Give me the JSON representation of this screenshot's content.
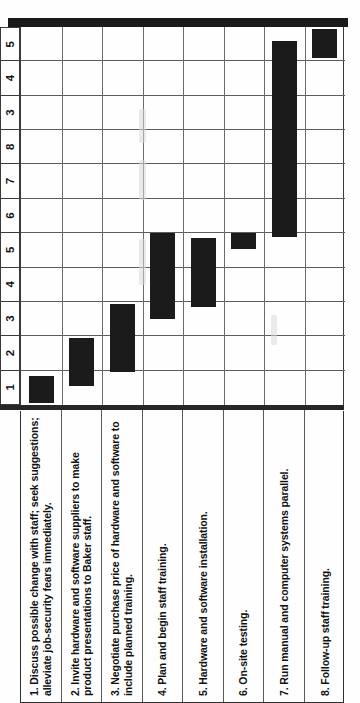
{
  "figure": {
    "kind": "gantt-chart",
    "orientation": "rotated-90",
    "group_labels": {
      "weeks": "Weeks",
      "months": "Months"
    }
  },
  "axis": {
    "week_ticks": [
      "1",
      "2",
      "3",
      "4",
      "5",
      "6",
      "7",
      "8"
    ],
    "month_ticks": [
      "3",
      "4",
      "5"
    ]
  },
  "tasks": [
    {
      "num": "1.",
      "text": "Discuss possible change with staff; seek suggestions; alleviate job-security fears immediately."
    },
    {
      "num": "2.",
      "text": "Invite hardware and software suppliers to make product presentations to Baker staff."
    },
    {
      "num": "3.",
      "text": "Negotiate purchase price of hardware and software to include planned training."
    },
    {
      "num": "4.",
      "text": "Plan and begin staff training."
    },
    {
      "num": "5.",
      "text": "Hardware and software installation."
    },
    {
      "num": "6.",
      "text": "On-site testing."
    },
    {
      "num": "7.",
      "text": "Run manual and computer systems parallel."
    },
    {
      "num": "8.",
      "text": "Follow-up staff training."
    }
  ],
  "chart_data": {
    "type": "bar",
    "title": "",
    "xlabel": "Weeks / Months",
    "ylabel": "",
    "categories": [
      "1. Discuss possible change with staff; seek suggestions; alleviate job-security fears immediately.",
      "2. Invite hardware and software suppliers to make product presentations to Baker staff.",
      "3. Negotiate purchase price of hardware and software to include planned training.",
      "4. Plan and begin staff training.",
      "5. Hardware and software installation.",
      "6. On-site testing.",
      "7. Run manual and computer systems parallel.",
      "8. Follow-up staff training."
    ],
    "time_scale": {
      "weeks": [
        1,
        2,
        3,
        4,
        5,
        6,
        7,
        8
      ],
      "months": [
        3,
        4,
        5
      ],
      "slots": [
        "W1",
        "W2",
        "W3",
        "W4",
        "W5",
        "W6",
        "W7",
        "W8",
        "M3",
        "M4",
        "M5"
      ]
    },
    "bars": [
      {
        "task": 1,
        "start_slot": 0.05,
        "end_slot": 0.85,
        "start_label": "Week 1",
        "end_label": "Week 1"
      },
      {
        "task": 2,
        "start_slot": 0.55,
        "end_slot": 1.95,
        "start_label": "Week 1",
        "end_label": "Week 2"
      },
      {
        "task": 3,
        "start_slot": 0.95,
        "end_slot": 2.95,
        "start_label": "Week 2",
        "end_label": "Week 3"
      },
      {
        "task": 4,
        "start_slot": 2.5,
        "end_slot": 5.0,
        "start_label": "Week 3",
        "end_label": "Week 5"
      },
      {
        "task": 5,
        "start_slot": 2.85,
        "end_slot": 4.85,
        "start_label": "Week 3",
        "end_label": "Week 5"
      },
      {
        "task": 6,
        "start_slot": 4.55,
        "end_slot": 5.0,
        "start_label": "Week 5",
        "end_label": "Week 5"
      },
      {
        "task": 7,
        "start_slot": 4.9,
        "end_slot": 10.6,
        "start_label": "Week 5",
        "end_label": "Month 5"
      },
      {
        "task": 8,
        "start_slot": 10.1,
        "end_slot": 10.95,
        "start_label": "Month 5",
        "end_label": "Month 5"
      }
    ],
    "grid": true,
    "legend": "none"
  }
}
